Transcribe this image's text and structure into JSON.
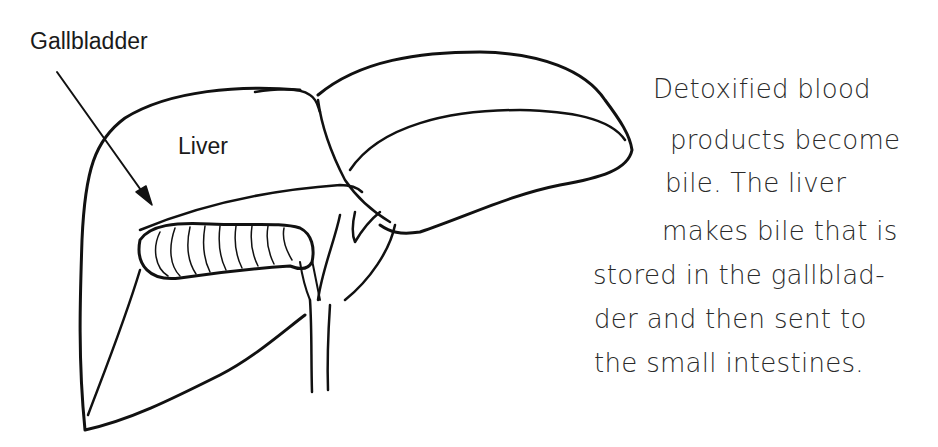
{
  "diagram": {
    "labels": {
      "gallbladder": "Gallbladder",
      "liver": "Liver"
    },
    "caption": {
      "lines": [
        "Detoxified blood",
        "products become",
        "bile. The liver",
        "makes bile that is",
        "stored in the gallblad-",
        "der and then sent to",
        "the small intestines."
      ]
    },
    "colors": {
      "background": "#ffffff",
      "ink": "#111111"
    }
  }
}
